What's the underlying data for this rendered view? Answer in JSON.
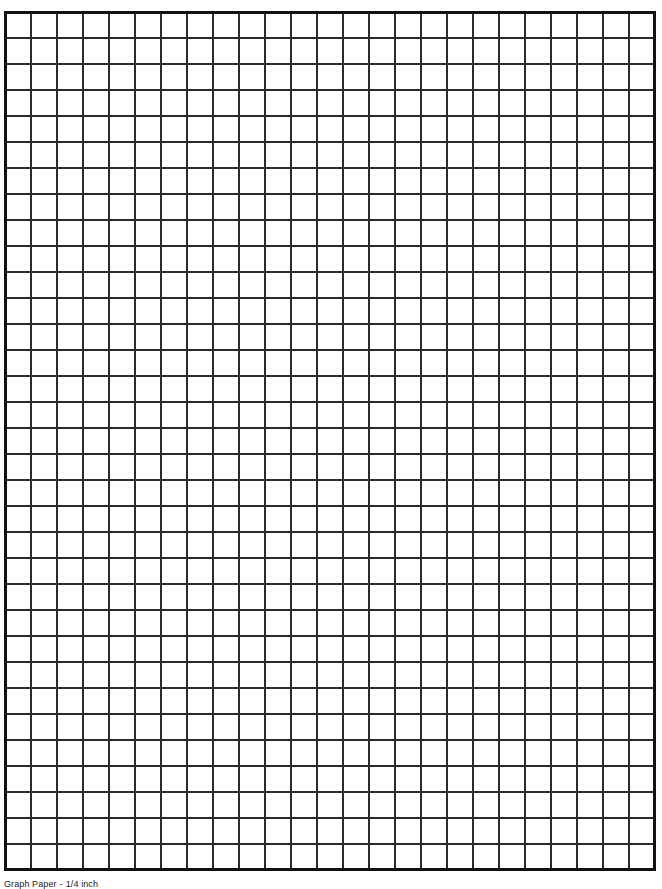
{
  "page": {
    "title": "Graph Paper",
    "background_color": "#ffffff",
    "width": 662,
    "height": 887
  },
  "grid": {
    "name": "graph-paper-grid",
    "columns": 25,
    "rows": 33,
    "cell_size_px": 26,
    "line_color": "#2b2b2b",
    "line_width_px": 2,
    "border_color": "#111111",
    "border_width_px": 3,
    "fill_color": "#ffffff",
    "origin_x_px": 4,
    "origin_y_px": 11
  },
  "footer": {
    "caption": "Graph Paper",
    "separator": "-",
    "scale_label": "1/4 inch"
  },
  "chart_data": {
    "type": "table",
    "title": "Graph Paper",
    "xlabel": "",
    "ylabel": "",
    "grid": true,
    "legend": "none",
    "columns": 25,
    "rows": 33,
    "cell_size_px": 26,
    "values": []
  }
}
